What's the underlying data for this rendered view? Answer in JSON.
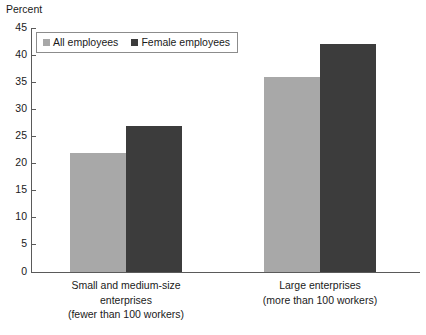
{
  "chart_data": {
    "type": "bar",
    "title": "",
    "ylabel": "Percent",
    "xlabel": "",
    "ylim": [
      0,
      45
    ],
    "ytick_step": 5,
    "yticks": [
      "45",
      "40",
      "35",
      "30",
      "25",
      "20",
      "15",
      "10",
      "5",
      "0"
    ],
    "grid": false,
    "legend_position": "top-left",
    "categories": [
      "Small and medium-size enterprises (fewer than 100 workers)",
      "Large enterprises (more than 100 workers)"
    ],
    "category_lines": [
      [
        "Small and medium-size",
        "enterprises",
        "(fewer than 100 workers)"
      ],
      [
        "Large enterprises",
        "(more than 100 workers)"
      ]
    ],
    "series": [
      {
        "name": "All employees",
        "color": "#a8a8a8",
        "values": [
          22,
          36
        ]
      },
      {
        "name": "Female employees",
        "color": "#3c3c3c",
        "values": [
          27,
          42
        ]
      }
    ]
  },
  "legend": {
    "items": [
      {
        "label": "All employees",
        "swatch": "legend-swatch-light"
      },
      {
        "label": "Female employees",
        "swatch": "legend-swatch-dark"
      }
    ]
  },
  "colors": {
    "series_all_employees": "#a8a8a8",
    "series_female_employees": "#3c3c3c",
    "axis": "#5a5a5a",
    "text": "#1a1a1a",
    "background": "#ffffff"
  }
}
